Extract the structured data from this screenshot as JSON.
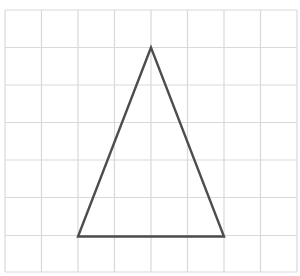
{
  "grid": {
    "x_lines": [
      5,
      41.5,
      78,
      114.5,
      151,
      187.5,
      224,
      260.5,
      297
    ],
    "y_lines": [
      10,
      47.5,
      85,
      122.5,
      160,
      197.5,
      235.5,
      272
    ],
    "color": "#d9d9d9",
    "stroke_width": 1.2
  },
  "triangle": {
    "points": [
      [
        151,
        47.5
      ],
      [
        78,
        236.5
      ],
      [
        224,
        236.5
      ]
    ],
    "color": "#4d4d4d",
    "stroke_width": 2.4
  }
}
